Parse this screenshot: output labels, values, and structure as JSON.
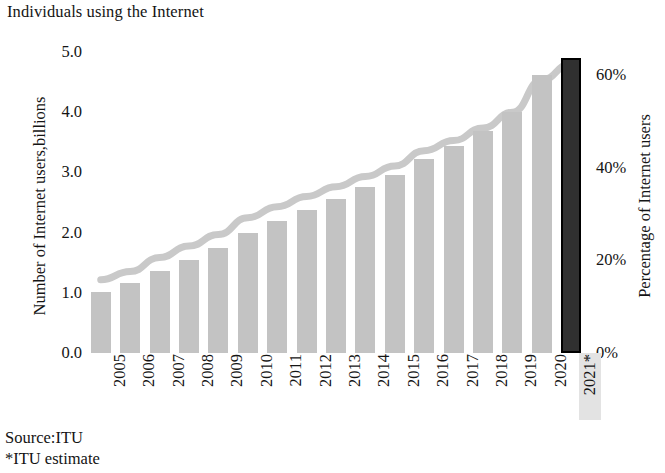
{
  "chart_data": {
    "type": "bar",
    "title": "Individuals using the Internet",
    "xlabel": "",
    "ylabel": "Number of Internet users,billions",
    "y2label": "Percentage of Internet users",
    "grid": false,
    "legend": "none",
    "categories": [
      "2005",
      "2006",
      "2007",
      "2008",
      "2009",
      "2010",
      "2011",
      "2012",
      "2013",
      "2014",
      "2015",
      "2016",
      "2017",
      "2018",
      "2019",
      "2020",
      "2021*"
    ],
    "ylim": [
      0.0,
      5.0
    ],
    "yticks": [
      "5.0",
      "4.0",
      "3.0",
      "2.0",
      "1.0",
      "0.0"
    ],
    "ytick_values": [
      5.0,
      4.0,
      3.0,
      2.0,
      1.0,
      0.0
    ],
    "y2lim": [
      0,
      65
    ],
    "y2ticks": [
      "60%",
      "40%",
      "20%",
      "0%"
    ],
    "y2tick_values": [
      60,
      40,
      20,
      0
    ],
    "series": [
      {
        "name": "Number of Internet users, billions",
        "type": "bar",
        "axis": "left",
        "values": [
          1.02,
          1.17,
          1.37,
          1.55,
          1.74,
          1.99,
          2.19,
          2.38,
          2.56,
          2.75,
          2.95,
          3.22,
          3.44,
          3.69,
          4.0,
          4.62,
          4.9
        ]
      },
      {
        "name": "Percentage of Internet users",
        "type": "line",
        "axis": "right",
        "values": [
          15.8,
          17.6,
          20.6,
          23.1,
          25.6,
          29.2,
          31.6,
          33.8,
          35.9,
          38.1,
          40.4,
          43.7,
          45.9,
          48.6,
          52.0,
          59.0,
          62.5
        ]
      }
    ],
    "estimate_category": "2021*",
    "estimate_note": "*ITU estimate",
    "source": "Source:ITU",
    "colors": {
      "bar": "#c3c3c3",
      "estimate_bar": "#303030",
      "estimate_bar_border": "#000000",
      "line": "#c9c9c9",
      "text": "#141414",
      "highlight": "#e3e3e3",
      "background": "#ffffff"
    }
  },
  "footer": {
    "source": "Source:ITU",
    "estimate_note": "*ITU estimate"
  }
}
